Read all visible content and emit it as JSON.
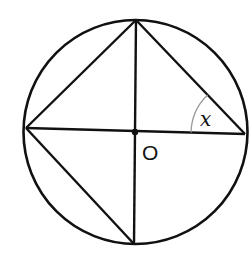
{
  "diagram": {
    "title": "",
    "circle": {
      "cx": 135.5,
      "cy": 132,
      "r": 112
    },
    "center": {
      "label": "O",
      "x": 135,
      "y": 132
    },
    "points": {
      "top": {
        "x": 136,
        "y": 20
      },
      "bottom": {
        "x": 134,
        "y": 244
      },
      "left": {
        "x": 26,
        "y": 128
      },
      "right": {
        "x": 245,
        "y": 134
      }
    },
    "segments": [
      "top-right",
      "top-left",
      "left-bottom",
      "top-bottom (diameter)",
      "left-right (diameter)"
    ],
    "angle": {
      "label": "x",
      "vertex": "right",
      "between": [
        "right-left",
        "right-top"
      ]
    },
    "colors": {
      "stroke": "#111111",
      "arc": "#9a9a9a",
      "background": "#ffffff"
    }
  }
}
